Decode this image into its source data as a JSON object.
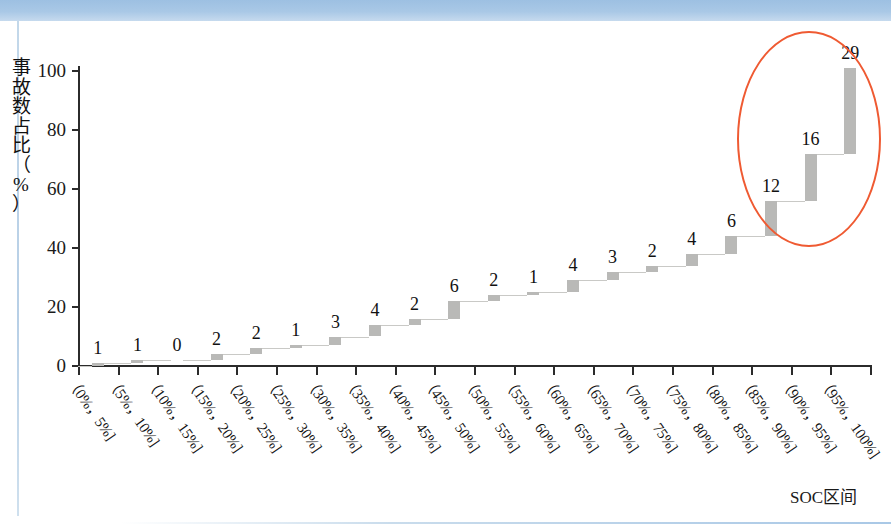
{
  "chart_data": {
    "type": "bar",
    "title": "",
    "subtitle": "",
    "xlabel": "SOC区间",
    "ylabel": "事故数占比（%）",
    "ylabel_chars": [
      "事",
      "故",
      "数",
      "占",
      "比",
      "（",
      "%",
      "）"
    ],
    "categories": [
      "（0%，5%]",
      "（5%，10%]",
      "（10%，15%]",
      "（15%，20%]",
      "（20%，25%]",
      "（25%，30%]",
      "（30%，35%]",
      "（35%，40%]",
      "（40%，45%]",
      "（45%，50%]",
      "（50%，55%]",
      "（55%，60%]",
      "（60%，65%]",
      "（65%，70%]",
      "（70%，75%]",
      "（75%，80%]",
      "（80%，85%]",
      "（85%，90%]",
      "（90%，95%]",
      "（95%，100%]"
    ],
    "values": [
      1,
      1,
      0,
      2,
      2,
      1,
      3,
      4,
      2,
      6,
      2,
      1,
      4,
      3,
      2,
      4,
      6,
      12,
      16,
      29
    ],
    "cumulative": [
      1,
      2,
      2,
      4,
      6,
      7,
      10,
      14,
      16,
      22,
      24,
      25,
      29,
      32,
      34,
      38,
      44,
      56,
      72,
      101
    ],
    "data_labels": [
      "1",
      "1",
      "0",
      "2",
      "2",
      "1",
      "3",
      "4",
      "2",
      "6",
      "2",
      "1",
      "4",
      "3",
      "2",
      "4",
      "6",
      "12",
      "16",
      "29"
    ],
    "ylim": [
      0,
      100
    ],
    "yticks": [
      0,
      20,
      40,
      60,
      80,
      100
    ],
    "ytick_labels": [
      "0",
      "20",
      "40",
      "60",
      "80",
      "100"
    ],
    "grid": false,
    "legend": "none",
    "series_style": "waterfall-cumulative-step",
    "bar_color": "#b9b9b7",
    "annotations": [
      {
        "name": "highlight-ellipse",
        "shape": "ellipse",
        "color": "#ef5a32",
        "covers_categories": [
          "（85%，90%]",
          "（90%，95%]",
          "（95%，100%]"
        ],
        "covers_values": [
          12,
          16,
          29
        ]
      }
    ]
  }
}
